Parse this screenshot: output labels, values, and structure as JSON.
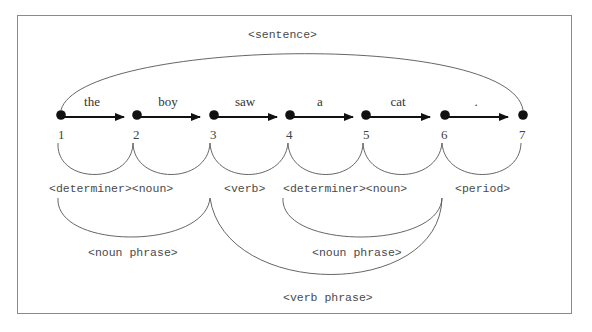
{
  "diagram": {
    "root_label": "<sentence>",
    "nodes": [
      "1",
      "2",
      "3",
      "4",
      "5",
      "6",
      "7"
    ],
    "edges": [
      {
        "from": "1",
        "to": "2",
        "word": "the"
      },
      {
        "from": "2",
        "to": "3",
        "word": "boy"
      },
      {
        "from": "3",
        "to": "4",
        "word": "saw"
      },
      {
        "from": "4",
        "to": "5",
        "word": "a"
      },
      {
        "from": "5",
        "to": "6",
        "word": "cat"
      },
      {
        "from": "6",
        "to": "7",
        "word": "."
      }
    ],
    "pos_labels": {
      "np1_det_noun": "<determiner><noun>",
      "verb": "<verb>",
      "np2_det_noun": "<determiner><noun>",
      "period": "<period>"
    },
    "phrase_labels": {
      "noun_phrase_1": "<noun phrase>",
      "noun_phrase_2": "<noun phrase>",
      "verb_phrase": "<verb phrase>"
    }
  }
}
